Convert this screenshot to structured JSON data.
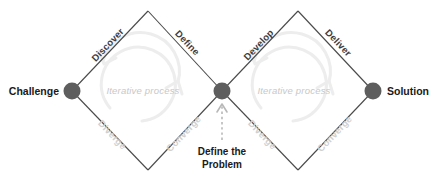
{
  "diagram": {
    "colors": {
      "node": "#5e5e5e",
      "edge": "#4a4a4a",
      "phase_text": "#3d3d3d",
      "flow_text": "#d0d0d0",
      "iterative_text": "#c8c8c8",
      "loop_arrow": "#ededed",
      "callout_arrow": "#b8b8b8",
      "background": "#ffffff"
    },
    "endpoints": [
      {
        "id": "challenge",
        "label": "Challenge"
      },
      {
        "id": "solution",
        "label": "Solution"
      }
    ],
    "diamonds": [
      {
        "id": "diamond-1",
        "top_left_label": "Discover",
        "top_right_label": "Define",
        "bottom_left_label": "Diverge",
        "bottom_right_label": "Converge",
        "center_label": "Iterative process"
      },
      {
        "id": "diamond-2",
        "top_left_label": "Develop",
        "top_right_label": "Deliver",
        "bottom_left_label": "Diverge",
        "bottom_right_label": "Converge",
        "center_label": "Iterative process"
      }
    ],
    "callout": {
      "line_1": "Define the",
      "line_2": "Problem"
    }
  }
}
